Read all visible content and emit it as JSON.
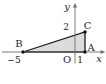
{
  "figure": {
    "background": "#ffffff",
    "axis_color": "#6e6e6e",
    "edge_color": "#1c1c1c",
    "fill_color": "#dcdcdc",
    "labels": {
      "y_axis": "y",
      "x_axis": "x",
      "origin": "O",
      "point_a": "A",
      "point_b": "B",
      "point_c": "C",
      "x_tick_b": "−5",
      "x_tick_a": "1",
      "y_tick_c": "2"
    },
    "points": {
      "A": {
        "x": 1,
        "y": 0
      },
      "B": {
        "x": -5,
        "y": 0
      },
      "C": {
        "x": 1,
        "y": 2
      }
    }
  }
}
